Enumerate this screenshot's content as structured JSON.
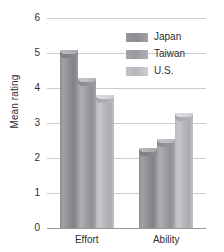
{
  "chart_data": {
    "type": "bar",
    "title": "",
    "subtitle": "",
    "xlabel": "",
    "ylabel": "Mean rating",
    "categories": [
      "Effort",
      "Ability"
    ],
    "series": [
      {
        "name": "Japan",
        "values": [
          5.1,
          2.3
        ],
        "color": "#8c8e92"
      },
      {
        "name": "Taiwan",
        "values": [
          4.3,
          2.55
        ],
        "color": "#9a9c9f"
      },
      {
        "name": "U.S.",
        "values": [
          3.8,
          3.3
        ],
        "color": "#b4b6b9"
      }
    ],
    "ylim": [
      0,
      6
    ],
    "yticks": [
      0,
      1,
      2,
      3,
      4,
      5,
      6
    ],
    "ytick_labels": [
      "0",
      "1",
      "2",
      "3",
      "4",
      "5",
      "6"
    ],
    "grid": true,
    "grid_axis": "y",
    "legend_position": "upper-right",
    "legend_entries": [
      "Japan",
      "Taiwan",
      "U.S."
    ],
    "annotations": [],
    "background_color": "#ffffff",
    "grid_color": "#c9cdd1",
    "text_color": "#2e2e2e"
  }
}
